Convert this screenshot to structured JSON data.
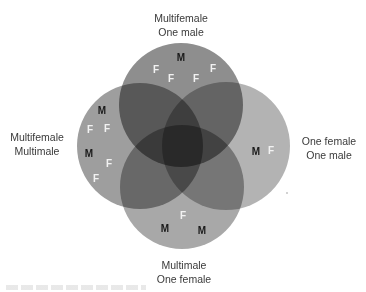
{
  "diagram": {
    "type": "venn",
    "sets": [
      {
        "id": "top",
        "label_lines": [
          "Multifemale",
          "One male"
        ],
        "color": "#8a8a8a",
        "symbols": [
          {
            "t": "M",
            "x": 181,
            "y": 57
          },
          {
            "t": "F",
            "x": 156,
            "y": 69
          },
          {
            "t": "F",
            "x": 171,
            "y": 78
          },
          {
            "t": "F",
            "x": 196,
            "y": 78
          },
          {
            "t": "F",
            "x": 213,
            "y": 68
          }
        ]
      },
      {
        "id": "left",
        "label_lines": [
          "Multifemale",
          "Multimale"
        ],
        "color": "#9e9e9e",
        "symbols": [
          {
            "t": "M",
            "x": 102,
            "y": 110
          },
          {
            "t": "F",
            "x": 90,
            "y": 129
          },
          {
            "t": "F",
            "x": 107,
            "y": 128
          },
          {
            "t": "M",
            "x": 89,
            "y": 153
          },
          {
            "t": "F",
            "x": 109,
            "y": 163
          },
          {
            "t": "F",
            "x": 96,
            "y": 178
          }
        ]
      },
      {
        "id": "right",
        "label_lines": [
          "One female",
          "One male"
        ],
        "color": "#b3b3b3",
        "symbols": [
          {
            "t": "M",
            "x": 256,
            "y": 151
          },
          {
            "t": "F",
            "x": 271,
            "y": 150
          }
        ]
      },
      {
        "id": "bottom",
        "label_lines": [
          "Multimale",
          "One female"
        ],
        "color": "#a5a5a5",
        "symbols": [
          {
            "t": "F",
            "x": 183,
            "y": 215
          },
          {
            "t": "M",
            "x": 165,
            "y": 228
          },
          {
            "t": "M",
            "x": 202,
            "y": 230
          }
        ]
      }
    ],
    "symbol_legend": {
      "M": "male",
      "F": "female"
    },
    "symbol_colors": {
      "M": "#1a1a1a",
      "F": "#f2f2f2"
    }
  }
}
